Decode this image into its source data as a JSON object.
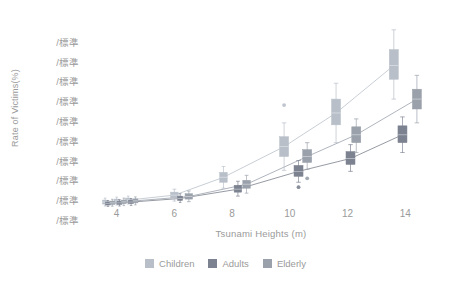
{
  "chart_data": {
    "type": "box",
    "title": "",
    "xlabel": "Tsunami Heights (m)",
    "ylabel": "Rate of Victims(%)",
    "xlim": [
      2.8,
      15.2
    ],
    "ylim": [
      0,
      100
    ],
    "grid": false,
    "legend_position": "bottom-center",
    "x_ticks": [
      "4",
      "6",
      "8",
      "10",
      "12",
      "14"
    ],
    "x_tick_values": [
      4,
      6,
      8,
      10,
      12,
      14
    ],
    "y_ticks": [
      "/標準",
      "/標準",
      "/標準",
      "/標準",
      "/標準",
      "/標準",
      "/標準",
      "/標準",
      "/標準",
      "/標準"
    ],
    "y_tick_values": [
      90,
      80,
      70,
      60,
      50,
      40,
      30,
      20,
      10,
      0
    ],
    "series": [
      {
        "name": "Children",
        "color": "#b8bfc9",
        "line_color": "#c2c8d0",
        "boxes": [
          {
            "x": 3.6,
            "q1": 2.0,
            "median": 3.0,
            "q3": 4.0,
            "low": 1.0,
            "high": 5.0,
            "outliers": []
          },
          {
            "x": 4.0,
            "q1": 2.5,
            "median": 3.5,
            "q3": 4.5,
            "low": 1.5,
            "high": 5.5,
            "outliers": []
          },
          {
            "x": 4.4,
            "q1": 3.0,
            "median": 4.0,
            "q3": 5.0,
            "low": 2.0,
            "high": 6.0,
            "outliers": []
          },
          {
            "x": 6.0,
            "q1": 5.0,
            "median": 6.5,
            "q3": 8.0,
            "low": 3.5,
            "high": 9.5,
            "outliers": []
          },
          {
            "x": 7.7,
            "q1": 13.0,
            "median": 15.5,
            "q3": 18.0,
            "low": 10.0,
            "high": 21.0,
            "outliers": []
          },
          {
            "x": 9.8,
            "q1": 26.0,
            "median": 31.0,
            "q3": 36.0,
            "low": 19.0,
            "high": 43.0,
            "outliers": [
              52.0
            ]
          },
          {
            "x": 11.6,
            "q1": 42.0,
            "median": 48.0,
            "q3": 55.0,
            "low": 33.0,
            "high": 63.0,
            "outliers": []
          },
          {
            "x": 13.6,
            "q1": 65.0,
            "median": 72.0,
            "q3": 80.0,
            "low": 55.0,
            "high": 90.0,
            "outliers": []
          }
        ],
        "line": [
          [
            3.6,
            3.0
          ],
          [
            4.0,
            3.5
          ],
          [
            4.4,
            4.0
          ],
          [
            6.0,
            6.5
          ],
          [
            7.7,
            15.5
          ],
          [
            9.8,
            31.0
          ],
          [
            11.6,
            48.0
          ],
          [
            13.6,
            72.0
          ]
        ]
      },
      {
        "name": "Adults",
        "color": "#7c8290",
        "line_color": "#8a8f99",
        "boxes": [
          {
            "x": 3.7,
            "q1": 1.5,
            "median": 2.2,
            "q3": 3.0,
            "low": 0.8,
            "high": 3.8,
            "outliers": []
          },
          {
            "x": 4.1,
            "q1": 1.8,
            "median": 2.6,
            "q3": 3.4,
            "low": 1.0,
            "high": 4.2,
            "outliers": []
          },
          {
            "x": 4.5,
            "q1": 2.2,
            "median": 3.0,
            "q3": 3.9,
            "low": 1.3,
            "high": 4.8,
            "outliers": []
          },
          {
            "x": 6.2,
            "q1": 3.8,
            "median": 4.8,
            "q3": 6.0,
            "low": 2.8,
            "high": 7.2,
            "outliers": []
          },
          {
            "x": 8.2,
            "q1": 8.0,
            "median": 9.5,
            "q3": 11.5,
            "low": 6.0,
            "high": 13.5,
            "outliers": []
          },
          {
            "x": 10.3,
            "q1": 16.0,
            "median": 18.5,
            "q3": 21.5,
            "low": 13.0,
            "high": 24.0,
            "outliers": [
              10.5
            ]
          },
          {
            "x": 12.1,
            "q1": 22.0,
            "median": 25.0,
            "q3": 28.5,
            "low": 18.5,
            "high": 32.0,
            "outliers": []
          },
          {
            "x": 13.9,
            "q1": 33.0,
            "median": 37.0,
            "q3": 41.5,
            "low": 28.0,
            "high": 46.0,
            "outliers": []
          }
        ],
        "line": [
          [
            3.7,
            2.2
          ],
          [
            4.1,
            2.6
          ],
          [
            4.5,
            3.0
          ],
          [
            6.2,
            4.8
          ],
          [
            8.2,
            9.5
          ],
          [
            10.3,
            18.5
          ],
          [
            12.1,
            25.0
          ],
          [
            13.9,
            37.0
          ]
        ]
      },
      {
        "name": "Elderly",
        "color": "#9aa1ab",
        "line_color": "#a6acb5",
        "boxes": [
          {
            "x": 3.85,
            "q1": 1.8,
            "median": 2.6,
            "q3": 3.5,
            "low": 0.9,
            "high": 4.4,
            "outliers": []
          },
          {
            "x": 4.25,
            "q1": 2.2,
            "median": 3.1,
            "q3": 4.0,
            "low": 1.2,
            "high": 5.0,
            "outliers": []
          },
          {
            "x": 4.65,
            "q1": 2.6,
            "median": 3.6,
            "q3": 4.6,
            "low": 1.6,
            "high": 5.6,
            "outliers": []
          },
          {
            "x": 6.5,
            "q1": 4.5,
            "median": 5.8,
            "q3": 7.2,
            "low": 3.2,
            "high": 8.6,
            "outliers": []
          },
          {
            "x": 8.5,
            "q1": 10.0,
            "median": 12.0,
            "q3": 14.0,
            "low": 7.5,
            "high": 16.5,
            "outliers": []
          },
          {
            "x": 10.6,
            "q1": 23.0,
            "median": 26.0,
            "q3": 29.5,
            "low": 19.5,
            "high": 33.0,
            "outliers": [
              15.0
            ]
          },
          {
            "x": 12.3,
            "q1": 33.0,
            "median": 37.0,
            "q3": 41.0,
            "low": 28.0,
            "high": 45.0,
            "outliers": []
          },
          {
            "x": 14.4,
            "q1": 50.0,
            "median": 55.0,
            "q3": 60.0,
            "low": 43.0,
            "high": 67.0,
            "outliers": []
          }
        ],
        "line": [
          [
            3.85,
            2.6
          ],
          [
            4.25,
            3.1
          ],
          [
            4.65,
            3.6
          ],
          [
            6.5,
            5.8
          ],
          [
            8.5,
            12.0
          ],
          [
            10.6,
            26.0
          ],
          [
            12.3,
            37.0
          ],
          [
            14.4,
            55.0
          ]
        ]
      }
    ]
  },
  "legend": {
    "items": [
      {
        "label": "Children",
        "color": "#b8bfc9"
      },
      {
        "label": "Adults",
        "color": "#7c8290"
      },
      {
        "label": "Elderly",
        "color": "#9aa1ab"
      }
    ]
  }
}
